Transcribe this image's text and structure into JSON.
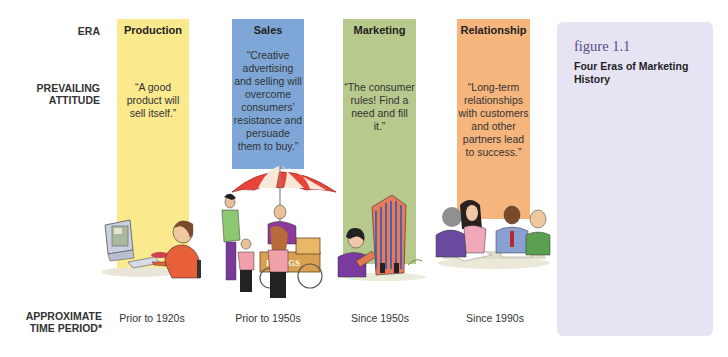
{
  "row_labels": {
    "era": "ERA",
    "attitude_line1": "PREVAILING",
    "attitude_line2": "ATTITUDE",
    "time_line1": "APPROXIMATE",
    "time_line2": "TIME PERIOD*"
  },
  "eras": [
    {
      "name": "Production",
      "color": "#fbe98e",
      "quote": "“A good product will sell itself.”",
      "period": "Prior to 1920s",
      "illustration": "person-at-computer-illustration"
    },
    {
      "name": "Sales",
      "color": "#7ea7d8",
      "quote": "“Creative advertising and selling will overcome consumers’ resistance and persuade them to buy.”",
      "period": "Prior to 1950s",
      "illustration": "hot-dog-vendor-illustration",
      "cart_sign": "HOT DOGS"
    },
    {
      "name": "Marketing",
      "color": "#b7c98c",
      "quote": "“The consumer rules! Find a need and fill it.”",
      "period": "Since 1950s",
      "illustration": "woman-with-clipboard-and-tower-illustration"
    },
    {
      "name": "Relationship",
      "color": "#f6b57c",
      "quote": "“Long-term relationships with customers and other partners lead to success.”",
      "period": "Since 1990s",
      "illustration": "business-meeting-illustration"
    }
  ],
  "figure": {
    "number": "figure 1.1",
    "title": "Four Eras of Marketing History",
    "panel_color": "#e6e3f3"
  }
}
